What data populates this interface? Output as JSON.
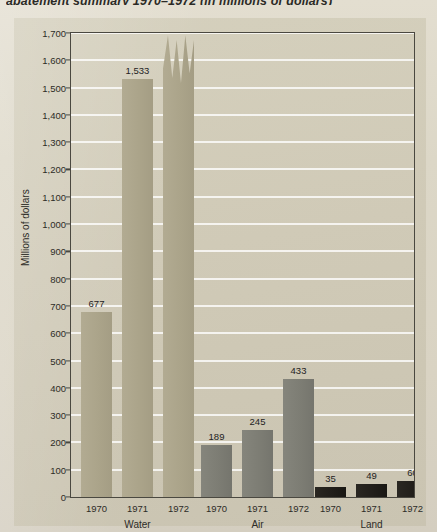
{
  "caption": "abatement summary 1970–1972 (in millions of dollars)",
  "colors": {
    "page_background": "#ded9ca",
    "panel_background": "#cfc9b6",
    "axis": "#4a4840",
    "gridline": "#ffffff",
    "water_bar": "#aba48a",
    "air_bar": "#7d7d74",
    "land_bar": "#211e1a",
    "text": "#2d2c27"
  },
  "chart_data": {
    "type": "bar",
    "title": "abatement summary 1970–1972 (in millions of dollars)",
    "xlabel": "",
    "ylabel": "Millions of dollars",
    "ylim": [
      0,
      1700
    ],
    "ytick_step": 100,
    "grid": true,
    "legend": "none",
    "axis_break_note": "1972 Water bar is drawn with a broken (torn) top because its value of 2,539 exceeds the 1,700 axis maximum.",
    "ytick_labels": [
      "0",
      "100",
      "200",
      "300",
      "400",
      "500",
      "600",
      "700",
      "800",
      "900",
      "1,000",
      "1,100",
      "1,200",
      "1,300",
      "1,400",
      "1,500",
      "1,600",
      "1,700"
    ],
    "ytick_values": [
      0,
      100,
      200,
      300,
      400,
      500,
      600,
      700,
      800,
      900,
      1000,
      1100,
      1200,
      1300,
      1400,
      1500,
      1600,
      1700
    ],
    "categories": [
      "1970",
      "1971",
      "1972"
    ],
    "groups": [
      {
        "name": "Water",
        "color": "#aba48a",
        "bars": [
          {
            "year": "1970",
            "value": 677,
            "label": "677",
            "broken": false
          },
          {
            "year": "1971",
            "value": 1533,
            "label": "1,533",
            "broken": false
          },
          {
            "year": "1972",
            "value": 2539,
            "label": "2,539",
            "broken": true
          }
        ]
      },
      {
        "name": "Air",
        "color": "#7d7d74",
        "bars": [
          {
            "year": "1970",
            "value": 189,
            "label": "189",
            "broken": false
          },
          {
            "year": "1971",
            "value": 245,
            "label": "245",
            "broken": false
          },
          {
            "year": "1972",
            "value": 433,
            "label": "433",
            "broken": false
          }
        ]
      },
      {
        "name": "Land",
        "color": "#211e1a",
        "bars": [
          {
            "year": "1970",
            "value": 35,
            "label": "35",
            "broken": false
          },
          {
            "year": "1971",
            "value": 49,
            "label": "49",
            "broken": false
          },
          {
            "year": "1972",
            "value": 60,
            "label": "60",
            "broken": false
          }
        ]
      }
    ]
  }
}
